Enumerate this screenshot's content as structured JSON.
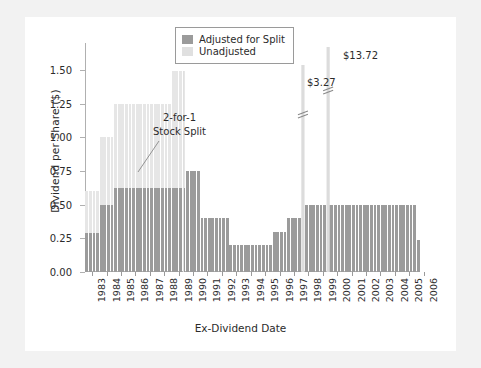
{
  "chart_data": {
    "type": "bar",
    "title": "",
    "xlabel": "Ex-Dividend Date",
    "ylabel": "Dividend per Share ($)",
    "ylim": [
      0.0,
      1.7
    ],
    "yticks": [
      "0.00",
      "0.25",
      "0.50",
      "0.75",
      "1.00",
      "1.25",
      "1.50"
    ],
    "ytick_values": [
      0.0,
      0.25,
      0.5,
      0.75,
      1.0,
      1.25,
      1.5
    ],
    "categories": [
      "1983",
      "1984",
      "1985",
      "1986",
      "1987",
      "1988",
      "1989",
      "1990",
      "1991",
      "1992",
      "1993",
      "1994",
      "1995",
      "1996",
      "1997",
      "1998",
      "1999",
      "2000",
      "2001",
      "2002",
      "2003",
      "2004",
      "2005",
      "2006"
    ],
    "grid": false,
    "legend_position": "top-center",
    "series": [
      {
        "name": "Adjusted for Split",
        "color": "#9b9b9b",
        "values": [
          0.29,
          0.5,
          0.625,
          0.625,
          0.625,
          0.625,
          0.625,
          0.75,
          0.4,
          0.4,
          0.2,
          0.2,
          0.2,
          0.3,
          0.4,
          0.5,
          0.5,
          0.5,
          0.5,
          0.5,
          0.5,
          0.5,
          0.5,
          0.24
        ]
      },
      {
        "name": "Unadjusted",
        "color": "#e6e6e6",
        "values": [
          0.6,
          1.0,
          1.25,
          1.25,
          1.25,
          1.25,
          1.49,
          null,
          null,
          null,
          null,
          null,
          null,
          null,
          null,
          3.27,
          13.72,
          null,
          null,
          null,
          null,
          null,
          null,
          null
        ]
      }
    ],
    "quarterly_adjusted": [
      0.29,
      0.29,
      0.29,
      0.29,
      0.5,
      0.5,
      0.5,
      0.5,
      0.625,
      0.625,
      0.625,
      0.625,
      0.625,
      0.625,
      0.625,
      0.625,
      0.625,
      0.625,
      0.625,
      0.625,
      0.625,
      0.625,
      0.625,
      0.625,
      0.625,
      0.625,
      0.625,
      0.625,
      0.75,
      0.75,
      0.75,
      0.75,
      0.4,
      0.4,
      0.4,
      0.4,
      0.4,
      0.4,
      0.4,
      0.4,
      0.2,
      0.2,
      0.2,
      0.2,
      0.2,
      0.2,
      0.2,
      0.2,
      0.2,
      0.2,
      0.2,
      0.2,
      0.3,
      0.3,
      0.3,
      0.3,
      0.4,
      0.4,
      0.4,
      0.4,
      0.5,
      0.5,
      0.5,
      0.5,
      0.5,
      0.5,
      0.5,
      0.5,
      0.5,
      0.5,
      0.5,
      0.5,
      0.5,
      0.5,
      0.5,
      0.5,
      0.5,
      0.5,
      0.5,
      0.5,
      0.5,
      0.5,
      0.5,
      0.5,
      0.5,
      0.5,
      0.5,
      0.5,
      0.5,
      0.5,
      0.5,
      0.5,
      0.24
    ],
    "annotations": [
      {
        "id": "split",
        "text_line1": "2-for-1",
        "text_line2": "Stock Split",
        "points_to_year": "1989"
      },
      {
        "id": "spike1",
        "text": "$3.27",
        "value": 3.27,
        "year": "1998",
        "broken_axis": true
      },
      {
        "id": "spike2",
        "text": "$13.72",
        "value": 13.72,
        "year": "1999",
        "broken_axis": true
      }
    ]
  },
  "legend": {
    "items": [
      {
        "label": "Adjusted for Split",
        "color": "#9b9b9b"
      },
      {
        "label": "Unadjusted",
        "color": "#e0e0e0"
      }
    ]
  },
  "colors": {
    "adjusted": "#9b9b9b",
    "unadjusted": "#e6e6e6",
    "spike": "#d8d8d8",
    "axis": "#b0b0b0",
    "text": "#2b2b2b",
    "page_background": "#f2f2f2",
    "figure_background": "#ffffff"
  }
}
